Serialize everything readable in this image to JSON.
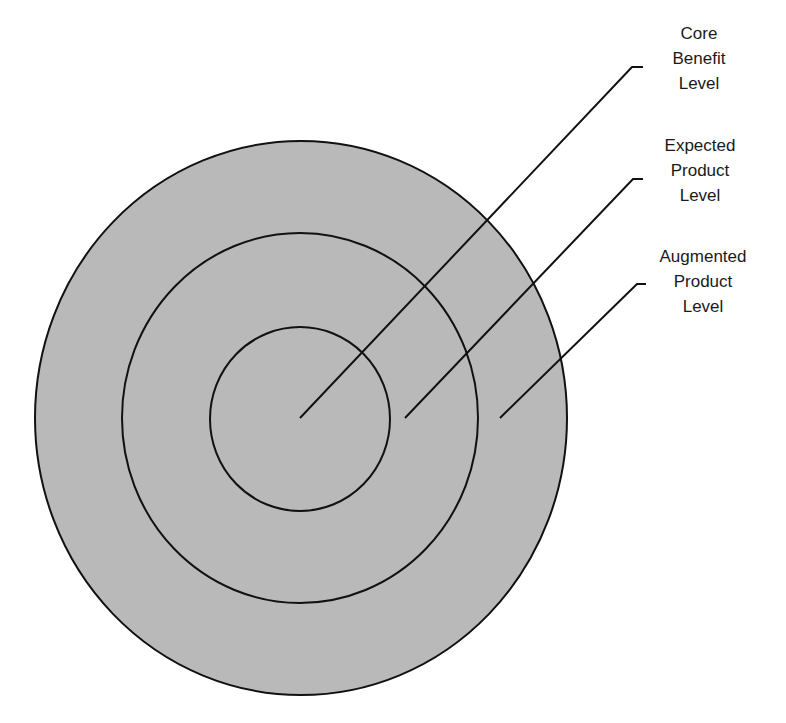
{
  "diagram": {
    "type": "concentric-levels",
    "colors": {
      "fill": "#b9b9b9",
      "stroke": "#111111",
      "text": "#1a1a1a",
      "background": "#ffffff"
    },
    "rings": [
      {
        "name": "augmented-product-ring",
        "cx": 301,
        "cy": 418,
        "rx": 266,
        "ry": 277
      },
      {
        "name": "expected-product-ring",
        "cx": 300,
        "cy": 418,
        "rx": 178,
        "ry": 185
      },
      {
        "name": "core-benefit-ring",
        "cx": 300,
        "cy": 419,
        "rx": 90,
        "ry": 92
      }
    ],
    "labels": [
      {
        "id": "core",
        "lines": [
          "Core",
          "Benefit",
          "Level"
        ],
        "x": 699,
        "y": 21,
        "leader": {
          "x1": 300,
          "y1": 418,
          "x2": 632,
          "y2": 67,
          "x3": 643
        }
      },
      {
        "id": "expected",
        "lines": [
          "Expected",
          "Product",
          "Level"
        ],
        "x": 700,
        "y": 133,
        "leader": {
          "x1": 405,
          "y1": 418,
          "x2": 633,
          "y2": 179,
          "x3": 643
        }
      },
      {
        "id": "augmented",
        "lines": [
          "Augmented",
          "Product",
          "Level"
        ],
        "x": 703,
        "y": 244,
        "leader": {
          "x1": 500,
          "y1": 418,
          "x2": 637,
          "y2": 284,
          "x3": 646
        }
      }
    ]
  }
}
